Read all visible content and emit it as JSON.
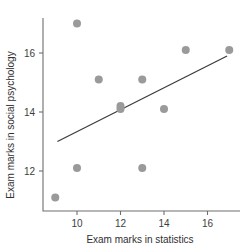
{
  "chart_data": {
    "type": "scatter",
    "title": "",
    "xlabel": "Exam marks in statistics",
    "ylabel": "Exam marks in social psychology",
    "xlim": [
      8.4,
      17.6
    ],
    "ylim": [
      10.7,
      17.4
    ],
    "xticks": [
      10,
      12,
      14,
      16
    ],
    "yticks": [
      12,
      14,
      16
    ],
    "xtick_labels": [
      "10",
      "12",
      "14",
      "16"
    ],
    "ytick_labels": [
      "12",
      "14",
      "16"
    ],
    "grid": false,
    "legend": null,
    "point_color": "#9a9a9a",
    "line_color": "#3a3a3a",
    "axis_color": "#6e6e6e",
    "points": [
      {
        "x": 9,
        "y": 11.1
      },
      {
        "x": 10,
        "y": 12.1
      },
      {
        "x": 10,
        "y": 17.0
      },
      {
        "x": 11,
        "y": 15.1
      },
      {
        "x": 12,
        "y": 14.1
      },
      {
        "x": 12,
        "y": 14.2
      },
      {
        "x": 13,
        "y": 12.1
      },
      {
        "x": 13,
        "y": 15.1
      },
      {
        "x": 14,
        "y": 14.1
      },
      {
        "x": 15,
        "y": 16.1
      },
      {
        "x": 17,
        "y": 16.1
      }
    ],
    "trendline": {
      "x_start": 9.1,
      "y_start": 13.0,
      "x_end": 16.9,
      "y_end": 15.9
    }
  }
}
